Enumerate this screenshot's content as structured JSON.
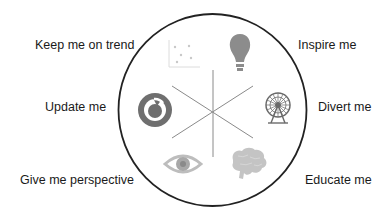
{
  "diagram": {
    "type": "radial-wheel",
    "segments": 6,
    "items": [
      {
        "label": "Keep me on trend",
        "icon": "scatter-plot-icon",
        "position": "top-left"
      },
      {
        "label": "Inspire me",
        "icon": "lightbulb-icon",
        "position": "top-right"
      },
      {
        "label": "Update me",
        "icon": "refresh-icon",
        "position": "left"
      },
      {
        "label": "Divert me",
        "icon": "ferris-wheel-icon",
        "position": "right"
      },
      {
        "label": "Give me perspective",
        "icon": "eye-icon",
        "position": "bottom-left"
      },
      {
        "label": "Educate me",
        "icon": "brain-icon",
        "position": "bottom-right"
      }
    ]
  },
  "colors": {
    "circle_stroke": "#222222",
    "spoke_stroke": "#8a8a8a",
    "icon_dark": "#6f6f6f",
    "icon_mid": "#8c8c8c",
    "icon_light": "#bdbdbd",
    "text": "#1a1a1a"
  }
}
